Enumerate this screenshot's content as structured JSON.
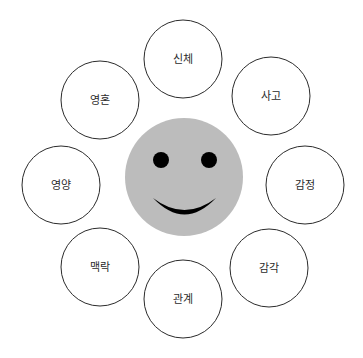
{
  "canvas": {
    "width": 363,
    "height": 358,
    "background_color": "#ffffff"
  },
  "diagram": {
    "type": "radial-hub-and-spoke",
    "hub": {
      "name": "smiley-face",
      "label": "",
      "center_x": 184,
      "center_y": 177,
      "radius": 59,
      "fill_color": "#bcbcbc",
      "eye_color": "#000000",
      "mouth_color": "#000000",
      "left_eye": {
        "cx": 161,
        "cy": 160,
        "r": 8
      },
      "right_eye": {
        "cx": 209,
        "cy": 160,
        "r": 8
      },
      "mouth": {
        "start_x": 153,
        "end_x": 216,
        "dip_y": 212,
        "baseline_y": 198
      }
    },
    "node_radius": 39,
    "node_fill_color": "#ffffff",
    "node_stroke_color": "#2b2b2b",
    "node_text_color": "#2b2b2b",
    "nodes": [
      {
        "id": "sinche",
        "label": "신체",
        "cx": 183,
        "cy": 59,
        "angle_deg": -90,
        "position": "top"
      },
      {
        "id": "sago",
        "label": "사고",
        "cx": 271,
        "cy": 96,
        "angle_deg": -45,
        "position": "top-right"
      },
      {
        "id": "gamjeong",
        "label": "감정",
        "cx": 305,
        "cy": 185,
        "angle_deg": 0,
        "position": "right"
      },
      {
        "id": "gamgak",
        "label": "감각",
        "cx": 269,
        "cy": 268,
        "angle_deg": 45,
        "position": "bottom-right"
      },
      {
        "id": "gwangye",
        "label": "관계",
        "cx": 183,
        "cy": 299,
        "angle_deg": 90,
        "position": "bottom"
      },
      {
        "id": "maengnak",
        "label": "맥락",
        "cx": 100,
        "cy": 267,
        "angle_deg": 135,
        "position": "bottom-left"
      },
      {
        "id": "yeongyang",
        "label": "영양",
        "cx": 61,
        "cy": 185,
        "angle_deg": 180,
        "position": "left"
      },
      {
        "id": "yeonghon",
        "label": "영혼",
        "cx": 100,
        "cy": 100,
        "angle_deg": -135,
        "position": "top-left"
      }
    ]
  }
}
